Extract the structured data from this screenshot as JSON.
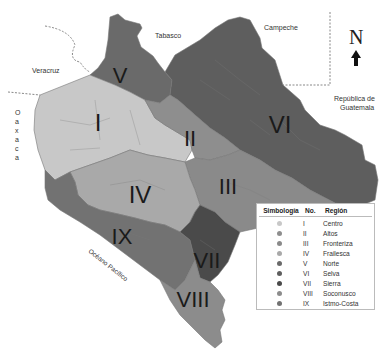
{
  "neighbors": {
    "tabasco": "Tabasco",
    "campeche": "Campeche",
    "veracruz": "Veracruz",
    "oaxaca": [
      "O",
      "a",
      "x",
      "a",
      "c",
      "a"
    ],
    "guatemala_line1": "República de",
    "guatemala_line2": "Guatemala",
    "ocean": "Océano Pacífico"
  },
  "north_arrow": {
    "label": "N"
  },
  "regions": [
    {
      "no": "I",
      "name": "Centro",
      "color": "#c8c8c8"
    },
    {
      "no": "II",
      "name": "Altos",
      "color": "#8e8e8e"
    },
    {
      "no": "III",
      "name": "Fronteriza",
      "color": "#8a8a8a"
    },
    {
      "no": "IV",
      "name": "Frailesca",
      "color": "#a9a9a9"
    },
    {
      "no": "V",
      "name": "Norte",
      "color": "#6a6a6a"
    },
    {
      "no": "VI",
      "name": "Selva",
      "color": "#5e5e5e"
    },
    {
      "no": "VII",
      "name": "Sierra",
      "color": "#4a4a4a"
    },
    {
      "no": "VIII",
      "name": "Soconusco",
      "color": "#8c8c8c"
    },
    {
      "no": "IX",
      "name": "Istmo-Costa",
      "color": "#727272"
    }
  ],
  "legend": {
    "header_symbol": "Simbología",
    "header_no": "No.",
    "header_region": "Región"
  }
}
